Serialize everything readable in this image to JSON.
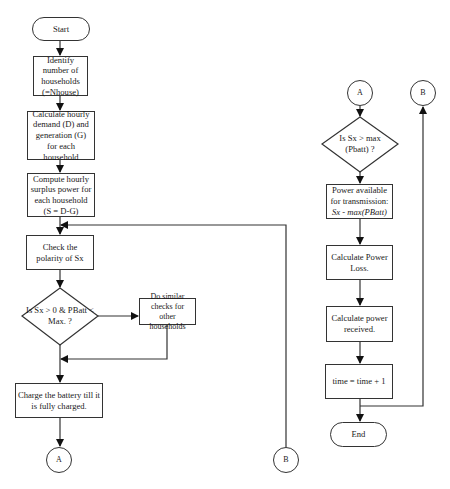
{
  "flowchart": {
    "start": "Start",
    "identify": "Identify number of households (=Nhouse)",
    "calculate_demand": "Calculate hourly demand (D) and generation (G) for each household",
    "compute_surplus": "Compute hourly surplus power for each household (S = D-G)",
    "check_polarity": "Check the polarity of Sx",
    "decision_1": "Is Sx > 0 & PBatt < Max. ?",
    "do_similar": "Do similar checks for other households",
    "charge_battery": "Charge the battery till it is fully charged.",
    "connector_a": "A",
    "connector_b": "B",
    "decision_2": "Is Sx > max (Pbatt) ?",
    "power_available_line1": "Power available for transmission:",
    "power_available_formula": "Sx - max(PBatt)",
    "power_loss": "Calculate Power Loss.",
    "power_received": "Calculate power received.",
    "time_increment": "time = time + 1",
    "end": "End"
  },
  "colors": {
    "stroke": "#333333",
    "background": "#ffffff",
    "text": "#1a1a1a"
  }
}
